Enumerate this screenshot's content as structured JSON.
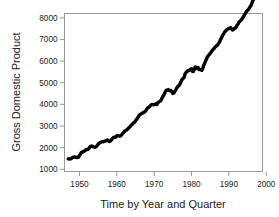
{
  "chart_data": {
    "type": "line",
    "title": "",
    "xlabel": "Time by Year and Quarter",
    "ylabel": "Gross Domestic Product",
    "xlim": [
      1946.0,
      1999.0
    ],
    "ylim": [
      900,
      8200
    ],
    "xticks": [
      1950,
      1960,
      1970,
      1980,
      1990,
      2000
    ],
    "xtick_labels": [
      "1950",
      "1960",
      "1970",
      "1980",
      "1990",
      "2000"
    ],
    "yticks": [
      1000,
      2000,
      3000,
      4000,
      5000,
      6000,
      7000,
      8000
    ],
    "ytick_labels": [
      "1000",
      "2000",
      "3000",
      "4000",
      "5000",
      "6000",
      "7000",
      "8000"
    ],
    "grid": false,
    "legend": null,
    "series_color": "#000000",
    "box_color": "#9a9a9a",
    "background": "#ffffff",
    "series": [
      {
        "name": "Gross Domestic Product",
        "x": [
          1947.0,
          1947.25,
          1947.5,
          1947.75,
          1948.0,
          1948.25,
          1948.5,
          1948.75,
          1949.0,
          1949.25,
          1949.5,
          1949.75,
          1950.0,
          1950.25,
          1950.5,
          1950.75,
          1951.0,
          1951.25,
          1951.5,
          1951.75,
          1952.0,
          1952.25,
          1952.5,
          1952.75,
          1953.0,
          1953.25,
          1953.5,
          1953.75,
          1954.0,
          1954.25,
          1954.5,
          1954.75,
          1955.0,
          1955.25,
          1955.5,
          1955.75,
          1956.0,
          1956.25,
          1956.5,
          1956.75,
          1957.0,
          1957.25,
          1957.5,
          1957.75,
          1958.0,
          1958.25,
          1958.5,
          1958.75,
          1959.0,
          1959.25,
          1959.5,
          1959.75,
          1960.0,
          1960.25,
          1960.5,
          1960.75,
          1961.0,
          1961.25,
          1961.5,
          1961.75,
          1962.0,
          1962.25,
          1962.5,
          1962.75,
          1963.0,
          1963.25,
          1963.5,
          1963.75,
          1964.0,
          1964.25,
          1964.5,
          1964.75,
          1965.0,
          1965.25,
          1965.5,
          1965.75,
          1966.0,
          1966.25,
          1966.5,
          1966.75,
          1967.0,
          1967.25,
          1967.5,
          1967.75,
          1968.0,
          1968.25,
          1968.5,
          1968.75,
          1969.0,
          1969.25,
          1969.5,
          1969.75,
          1970.0,
          1970.25,
          1970.5,
          1970.75,
          1971.0,
          1971.25,
          1971.5,
          1971.75,
          1972.0,
          1972.25,
          1972.5,
          1972.75,
          1973.0,
          1973.25,
          1973.5,
          1973.75,
          1974.0,
          1974.25,
          1974.5,
          1974.75,
          1975.0,
          1975.25,
          1975.5,
          1975.75,
          1976.0,
          1976.25,
          1976.5,
          1976.75,
          1977.0,
          1977.25,
          1977.5,
          1977.75,
          1978.0,
          1978.25,
          1978.5,
          1978.75,
          1979.0,
          1979.25,
          1979.5,
          1979.75,
          1980.0,
          1980.25,
          1980.5,
          1980.75,
          1981.0,
          1981.25,
          1981.5,
          1981.75,
          1982.0,
          1982.25,
          1982.5,
          1982.75,
          1983.0,
          1983.25,
          1983.5,
          1983.75,
          1984.0,
          1984.25,
          1984.5,
          1984.75,
          1985.0,
          1985.25,
          1985.5,
          1985.75,
          1986.0,
          1986.25,
          1986.5,
          1986.75,
          1987.0,
          1987.25,
          1987.5,
          1987.75,
          1988.0,
          1988.25,
          1988.5,
          1988.75,
          1989.0,
          1989.25,
          1989.5,
          1989.75,
          1990.0,
          1990.25,
          1990.5,
          1990.75,
          1991.0,
          1991.25,
          1991.5,
          1991.75,
          1992.0,
          1992.25,
          1992.5,
          1992.75,
          1993.0,
          1993.25,
          1993.5,
          1993.75,
          1994.0,
          1994.25,
          1994.5,
          1994.75,
          1995.0,
          1995.25,
          1995.5,
          1995.75,
          1996.0,
          1996.25,
          1996.5,
          1996.75,
          1997.0,
          1997.25,
          1997.5,
          1997.75,
          1998.0,
          1998.25
        ],
        "y": [
          1481,
          1475,
          1480,
          1490,
          1526,
          1555,
          1570,
          1569,
          1553,
          1549,
          1575,
          1555,
          1636,
          1702,
          1772,
          1794,
          1822,
          1836,
          1866,
          1906,
          1916,
          1918,
          1953,
          2027,
          2063,
          2079,
          2063,
          2037,
          2020,
          2022,
          2053,
          2098,
          2161,
          2202,
          2232,
          2257,
          2272,
          2268,
          2285,
          2301,
          2318,
          2326,
          2352,
          2331,
          2286,
          2303,
          2352,
          2403,
          2453,
          2484,
          2478,
          2492,
          2556,
          2561,
          2553,
          2534,
          2540,
          2592,
          2639,
          2687,
          2743,
          2781,
          2803,
          2833,
          2878,
          2913,
          2963,
          3011,
          3065,
          3105,
          3152,
          3167,
          3237,
          3298,
          3352,
          3417,
          3498,
          3537,
          3559,
          3595,
          3599,
          3637,
          3667,
          3697,
          3777,
          3835,
          3863,
          3891,
          3949,
          3983,
          3998,
          3984,
          3982,
          4002,
          4026,
          3993,
          4077,
          4116,
          4140,
          4166,
          4253,
          4342,
          4405,
          4494,
          4591,
          4656,
          4656,
          4684,
          4648,
          4631,
          4647,
          4588,
          4505,
          4520,
          4602,
          4650,
          4742,
          4816,
          4846,
          4899,
          4972,
          5072,
          5160,
          5209,
          5233,
          5396,
          5471,
          5515,
          5558,
          5551,
          5592,
          5626,
          5647,
          5522,
          5523,
          5621,
          5732,
          5659,
          5678,
          5705,
          5616,
          5616,
          5609,
          5575,
          5654,
          5796,
          5896,
          5998,
          6097,
          6199,
          6250,
          6297,
          6360,
          6412,
          6488,
          6527,
          6573,
          6637,
          6682,
          6706,
          6753,
          6828,
          6885,
          6997,
          7056,
          7164,
          7232,
          7312,
          7373,
          7408,
          7459,
          7476,
          7507,
          7536,
          7544,
          7483,
          7438,
          7470,
          7511,
          7525,
          7597,
          7670,
          7723,
          7816,
          7848,
          7894,
          7949,
          8002,
          8080,
          8161,
          8229,
          8301,
          8349,
          8385,
          8463,
          8522,
          8599,
          8716,
          8818,
          8899,
          8977,
          9083,
          9163,
          9268,
          9354,
          9475
        ],
        "label_first_value": 1481,
        "label_last_value": 7600,
        "point_count": 206
      }
    ]
  },
  "axes": {
    "y_title": "Gross Domestic Product",
    "x_title": "Time by Year and Quarter"
  }
}
